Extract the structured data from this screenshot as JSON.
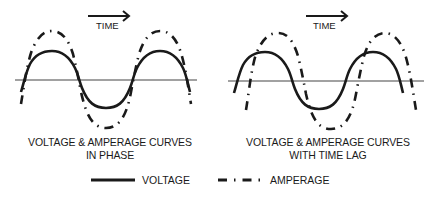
{
  "panels": [
    {
      "id": "in-phase",
      "time_label": "TIME",
      "caption_line1": "VOLTAGE & AMPERAGE CURVES",
      "caption_line2": "IN PHASE"
    },
    {
      "id": "time-lag",
      "time_label": "TIME",
      "caption_line1": "VOLTAGE & AMPERAGE CURVES",
      "caption_line2": "WITH TIME LAG"
    }
  ],
  "legend": {
    "voltage": "VOLTAGE",
    "amperage": "AMPERAGE"
  },
  "colors": {
    "line": "#1a1a1a",
    "axis": "#444444"
  }
}
